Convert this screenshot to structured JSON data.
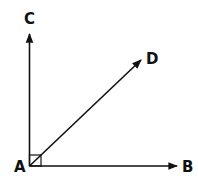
{
  "diagram": {
    "type": "angle-rays",
    "vertex": "A",
    "points": {
      "A": "A",
      "B": "B",
      "C": "C",
      "D": "D"
    },
    "rays": [
      {
        "name": "AC",
        "from": "A",
        "to": "C"
      },
      {
        "name": "AD",
        "from": "A",
        "to": "D"
      },
      {
        "name": "AB",
        "from": "A",
        "to": "B"
      }
    ],
    "right_angle_marker": {
      "angle": "CAB",
      "degrees": 90
    },
    "color": "#111111"
  }
}
